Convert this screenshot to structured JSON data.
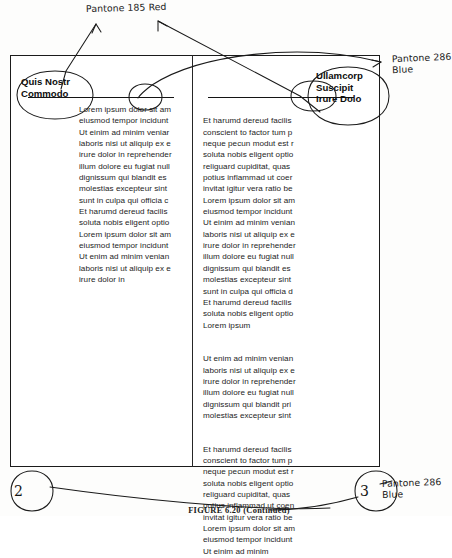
{
  "figure": {
    "caption": "FIGURE 6.20   (Continued)"
  },
  "annotations": {
    "top": "Pantone 185 Red",
    "right": "Pantone 286\nBlue",
    "bottom_right": "Pantone 286\nBlue"
  },
  "page_markers": {
    "left": "2",
    "right": "3"
  },
  "proof": {
    "left_column": {
      "headline": "Quis Nostr\nCommodo",
      "body": "Lorem ipsum dolor sit am\neiusmod tempor incidunt\nUt einim ad minim veniar\nlaboris nisi ut aliquip ex e\nirure dolor in reprehender\nillum dolore eu fugiat null\ndignissum qui blandit es\nmolestias excepteur sint\nsunt in culpa qui officia c\nEt harumd dereud facilis\nsoluta nobis eligent optio\nLorem ipsum dolor sit am\neiusmod tempor incidunt\nUt enim ad minim venian\nlaboris nisi ut aliquip ex e\nirure dolor in"
    },
    "right_column": {
      "headline": "Ullamcorp\nSuscipit\nIrure Dolo",
      "paragraphs": [
        "Et harumd dereud facilis\nconscient to factor tum p\nneque pecun modut est r\nsoluta nobis eligent optio\nreliguard cupiditat, quas\npotius inflammad ut coer\ninvitat igitur vera ratio be\nLorem ipsum dolor sit am\neiusmod tempor incidunt\nUt einim ad minim venian\nlaboris nisi ut aliquip ex e\nirure dolor in reprehender\nillum dolore eu fugiat null\ndignissum qui blandit es\nmolestias excepteur sint\nsunt in culpa qui officia d\nEt harumd dereud facilis\nsoluta nobis eligent optio\nLorem ipsum",
        "Ut enim ad minim venian\nlaboris nisi ut aliquip ex e\nirure dolor in reprehender\nillum dolore eu fugiat null\ndignissum qui blandit pri\nmolestias excepteur sint",
        "Et harumd dereud facilis\nconscient to factor tum p\nneque pecun modut est r\nsoluta nobis eligent optio\nreliguard cupiditat, quas\npotius inflammad ut coen\ninvitat igitur vera ratio be\nLorem ipsum dolor sit am\neiusmod tempor incidunt\nUt einim ad minim"
      ]
    }
  }
}
